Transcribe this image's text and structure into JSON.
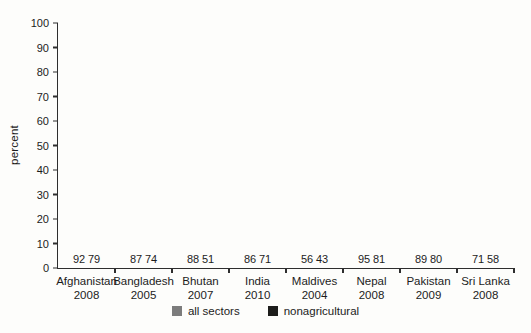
{
  "chart_data": {
    "type": "bar",
    "title": "",
    "ylabel": "percent",
    "xlabel": "",
    "ylim": [
      0,
      100
    ],
    "ytick_step": 10,
    "grid": false,
    "legend_position": "bottom-center",
    "categories": [
      {
        "country": "Afghanistan",
        "year": "2008"
      },
      {
        "country": "Bangladesh",
        "year": "2005"
      },
      {
        "country": "Bhutan",
        "year": "2007"
      },
      {
        "country": "India",
        "year": "2010"
      },
      {
        "country": "Maldives",
        "year": "2004"
      },
      {
        "country": "Nepal",
        "year": "2008"
      },
      {
        "country": "Pakistan",
        "year": "2009"
      },
      {
        "country": "Sri Lanka",
        "year": "2008"
      }
    ],
    "series": [
      {
        "name": "all sectors",
        "color": "#7c7c7c",
        "values": [
          92,
          87,
          88,
          86,
          56,
          95,
          89,
          71
        ]
      },
      {
        "name": "nonagricultural",
        "color": "#1d1d1b",
        "values": [
          79,
          74,
          51,
          71,
          43,
          81,
          80,
          58
        ]
      }
    ]
  },
  "colors": {
    "axis": "#2e2e2e",
    "text": "#1c1c1c",
    "background": "#fdfdfb"
  }
}
